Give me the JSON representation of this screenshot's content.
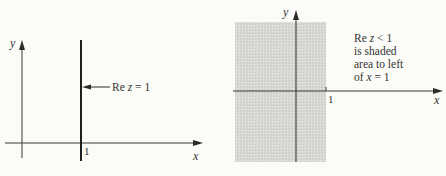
{
  "figures": [
    {
      "id": "left",
      "description": "Vertical line Re z = 1 in the complex plane",
      "axes": {
        "x_label": "x",
        "y_label": "y",
        "tick_label": "1"
      },
      "annotation": {
        "prefix": "Re ",
        "var": "z",
        "suffix": " = 1"
      }
    },
    {
      "id": "right",
      "description": "Half-plane Re z < 1 shaded",
      "axes": {
        "x_label": "x",
        "y_label": "y",
        "tick_label": "1"
      },
      "annotation_lines": [
        {
          "prefix": "Re ",
          "var": "z",
          "suffix": " < 1"
        },
        {
          "text": "is shaded"
        },
        {
          "text": "area to left"
        },
        {
          "prefix": "of ",
          "var": "x",
          "suffix": " = 1"
        }
      ]
    }
  ],
  "colors": {
    "background": "#fbfbf7",
    "ink": "#2b2b2b",
    "shade": "#d6d6d4"
  }
}
